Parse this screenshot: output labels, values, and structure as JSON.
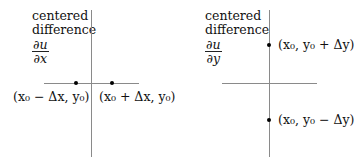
{
  "diagrams": [
    {
      "id": "dx",
      "title_lines": [
        "centered",
        "difference"
      ],
      "derivative": {
        "numerator": "∂u",
        "denominator": "∂x"
      },
      "points": [
        {
          "label": "(x₀ − Δx, y₀)",
          "position": "left"
        },
        {
          "label": "(x₀ + Δx, y₀)",
          "position": "right"
        }
      ]
    },
    {
      "id": "dy",
      "title_lines": [
        "centered",
        "difference"
      ],
      "derivative": {
        "numerator": "∂u",
        "denominator": "∂y"
      },
      "points": [
        {
          "label": "(x₀, y₀ + Δy)",
          "position": "top"
        },
        {
          "label": "(x₀, y₀ − Δy)",
          "position": "bottom"
        }
      ]
    }
  ],
  "colors": {
    "axis": "#8a8a8a",
    "dot": "#000000",
    "text": "#111111"
  }
}
